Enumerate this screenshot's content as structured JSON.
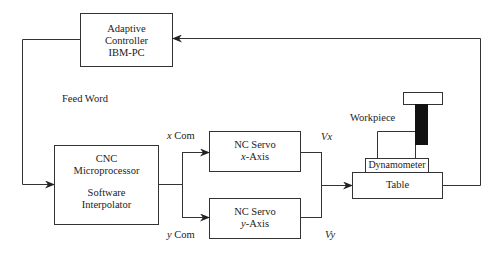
{
  "diagram": {
    "blocks": {
      "adaptive_controller": {
        "lines": [
          "Adaptive",
          "Controller",
          "IBM-PC"
        ]
      },
      "cnc": {
        "line1": "CNC",
        "line2": "Microprocessor",
        "line3": "Software",
        "line4": "Interpolator"
      },
      "servo_x": {
        "line1": "NC Servo",
        "axis_var": "x",
        "axis_suffix": "-Axis"
      },
      "servo_y": {
        "line1": "NC Servo",
        "axis_var": "y",
        "axis_suffix": "-Axis"
      },
      "table": {
        "label": "Table"
      },
      "dynamometer": {
        "label": "Dynamometer"
      }
    },
    "labels": {
      "feed_word": "Feed Word",
      "x_com_var": "x",
      "x_com": "Com",
      "y_com_var": "y",
      "y_com": "Com",
      "vx": "Vx",
      "vy": "Vy",
      "workpiece": "Workpiece"
    },
    "colors": {
      "line": "#333333",
      "tool": "#111111",
      "background": "#ffffff"
    }
  }
}
